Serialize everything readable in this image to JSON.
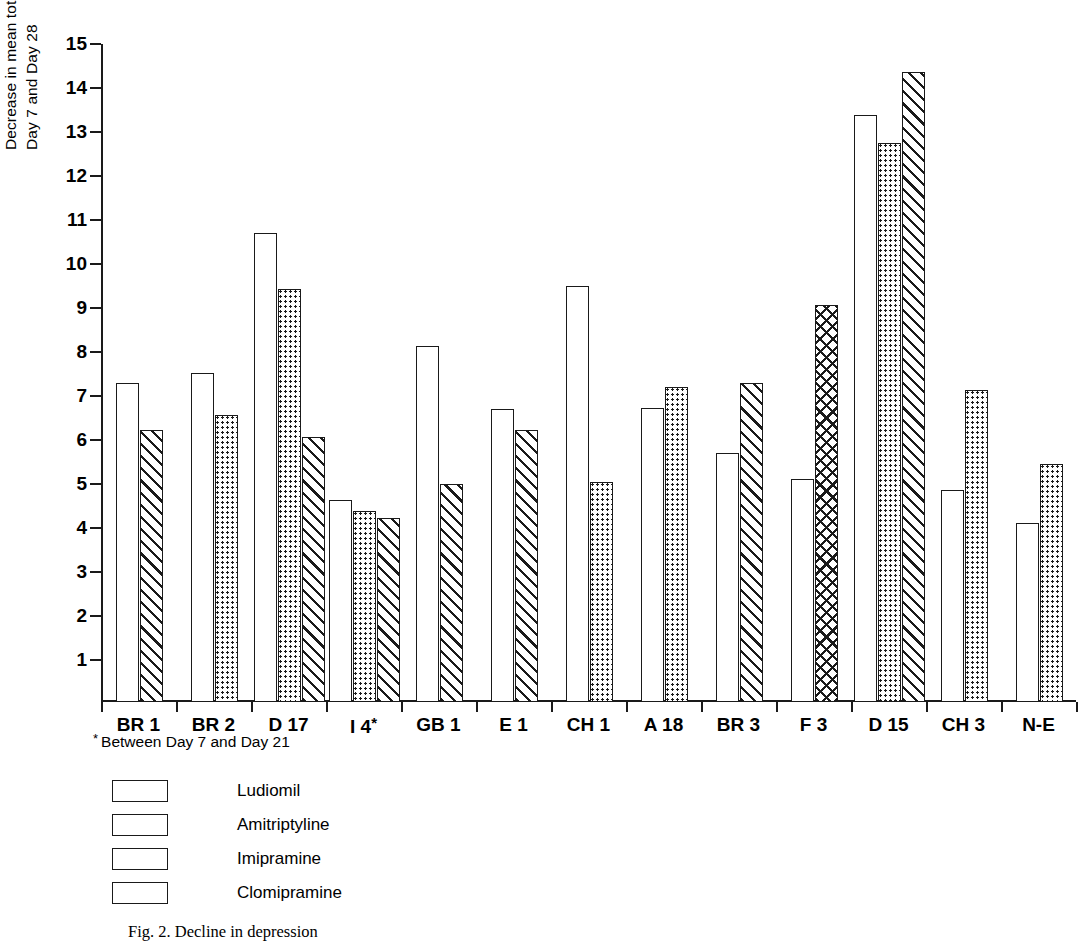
{
  "chart_data": {
    "type": "bar",
    "title": "",
    "xlabel": "",
    "ylabel": "Decrease in mean total Hamilton scores (adjusted) between Day 7 and Day 28",
    "ylabel_lines": [
      "Decrease in mean total Hamilton scores (adjusted) between",
      "Day 7 and Day 28"
    ],
    "ylim": [
      0,
      15
    ],
    "yticks": [
      15,
      14,
      13,
      12,
      11,
      10,
      9,
      8,
      7,
      6,
      5,
      4,
      3,
      2,
      1
    ],
    "ytick_labels": [
      "15",
      "14",
      "13",
      "12",
      "11",
      "10",
      "9",
      "8",
      "7",
      "6",
      "5",
      "4",
      "3",
      "2",
      "1"
    ],
    "grid": false,
    "legend_position": "below-left",
    "categories": [
      "BR 1",
      "BR 2",
      "D 17",
      "I 4*",
      "GB 1",
      "E 1",
      "CH 1",
      "A 18",
      "BR 3",
      "F 3",
      "D 15",
      "CH 3",
      "N-E"
    ],
    "series": [
      {
        "name": "Ludiomil",
        "pattern": "open",
        "values": [
          7.25,
          7.48,
          10.65,
          4.58,
          8.1,
          6.65,
          9.45,
          6.68,
          5.65,
          5.07,
          13.33,
          4.82,
          4.07
        ]
      },
      {
        "name": "Amitriptyline",
        "pattern": "dotted",
        "values": [
          null,
          6.53,
          9.38,
          4.35,
          null,
          null,
          5.0,
          7.15,
          null,
          null,
          12.7,
          7.1,
          5.42
        ]
      },
      {
        "name": "Imipramine",
        "pattern": "diagonal-hatch",
        "values": [
          6.18,
          null,
          6.03,
          4.18,
          4.95,
          6.18,
          null,
          null,
          7.25,
          null,
          14.32,
          null,
          null
        ]
      },
      {
        "name": "Clomipramine",
        "pattern": "cross-hatch",
        "values": [
          null,
          null,
          null,
          null,
          null,
          null,
          null,
          null,
          null,
          9.03,
          null,
          null,
          null
        ]
      }
    ],
    "groups": [
      {
        "category": "BR 1",
        "bars": [
          {
            "series": "Ludiomil",
            "value": 7.25
          },
          {
            "series": "Imipramine",
            "value": 6.18
          }
        ]
      },
      {
        "category": "BR 2",
        "bars": [
          {
            "series": "Ludiomil",
            "value": 7.48
          },
          {
            "series": "Amitriptyline",
            "value": 6.53
          }
        ]
      },
      {
        "category": "D 17",
        "bars": [
          {
            "series": "Ludiomil",
            "value": 10.65
          },
          {
            "series": "Amitriptyline",
            "value": 9.38
          },
          {
            "series": "Imipramine",
            "value": 6.03
          }
        ]
      },
      {
        "category": "I 4*",
        "bars": [
          {
            "series": "Ludiomil",
            "value": 4.58
          },
          {
            "series": "Amitriptyline",
            "value": 4.35
          },
          {
            "series": "Imipramine",
            "value": 4.18
          }
        ]
      },
      {
        "category": "GB 1",
        "bars": [
          {
            "series": "Ludiomil",
            "value": 8.1
          },
          {
            "series": "Imipramine",
            "value": 4.95
          }
        ]
      },
      {
        "category": "E 1",
        "bars": [
          {
            "series": "Ludiomil",
            "value": 6.65
          },
          {
            "series": "Imipramine",
            "value": 6.18
          }
        ]
      },
      {
        "category": "CH 1",
        "bars": [
          {
            "series": "Ludiomil",
            "value": 9.45
          },
          {
            "series": "Amitriptyline",
            "value": 5.0
          }
        ]
      },
      {
        "category": "A 18",
        "bars": [
          {
            "series": "Ludiomil",
            "value": 6.68
          },
          {
            "series": "Amitriptyline",
            "value": 7.15
          }
        ]
      },
      {
        "category": "BR 3",
        "bars": [
          {
            "series": "Ludiomil",
            "value": 5.65
          },
          {
            "series": "Imipramine",
            "value": 7.25
          }
        ]
      },
      {
        "category": "F 3",
        "bars": [
          {
            "series": "Ludiomil",
            "value": 5.07
          },
          {
            "series": "Clomipramine",
            "value": 9.03
          }
        ]
      },
      {
        "category": "D 15",
        "bars": [
          {
            "series": "Ludiomil",
            "value": 13.33
          },
          {
            "series": "Amitriptyline",
            "value": 12.7
          },
          {
            "series": "Imipramine",
            "value": 14.32
          }
        ]
      },
      {
        "category": "CH 3",
        "bars": [
          {
            "series": "Ludiomil",
            "value": 4.82
          },
          {
            "series": "Amitriptyline",
            "value": 7.1
          }
        ]
      },
      {
        "category": "N-E",
        "bars": [
          {
            "series": "Ludiomil",
            "value": 4.07
          },
          {
            "series": "Amitriptyline",
            "value": 5.42
          }
        ]
      }
    ],
    "annotations": [
      "* Between Day 7 and Day 21"
    ],
    "colors": {
      "ink": "#1a1a1a",
      "background": "#ffffff"
    }
  },
  "footnote": {
    "star": "*",
    "text": "Between Day 7 and Day 21"
  },
  "legend": {
    "items": [
      {
        "label": "Ludiomil",
        "pattern": "open"
      },
      {
        "label": "Amitriptyline",
        "pattern": "dotted"
      },
      {
        "label": "Imipramine",
        "pattern": "diagonal-hatch"
      },
      {
        "label": "Clomipramine",
        "pattern": "cross-hatch"
      }
    ]
  },
  "caption": {
    "text": "Fig. 2. Decline in depression"
  }
}
